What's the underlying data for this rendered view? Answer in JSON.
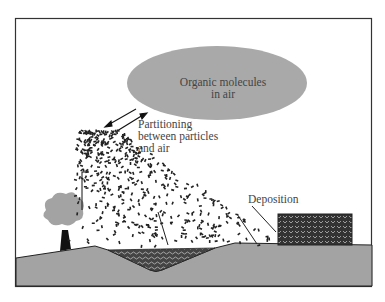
{
  "diagram": {
    "labels": {
      "cloud": "Organic molecules\nin air",
      "partitioning": "Partitioning\nbetween particles\nand air",
      "deposition": "Deposition"
    },
    "elements": [
      "frame",
      "air-molecules-ellipse",
      "partitioning-arrows",
      "particle-cloud",
      "tree",
      "water-body",
      "building",
      "ground",
      "deposition-arrows"
    ],
    "colors": {
      "ellipse": "#a9a9a9",
      "ground": "#a3a3a3",
      "frame": "#333333",
      "text": "#444444",
      "particles": "#222222"
    }
  }
}
